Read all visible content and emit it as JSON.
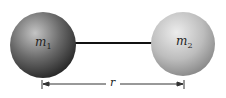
{
  "diagram": {
    "mass1": {
      "label": "m",
      "subscript": "1",
      "color_light": "#b8b8b8",
      "color_dark": "#3a3a3a"
    },
    "mass2": {
      "label": "m",
      "subscript": "2",
      "color_light": "#e6e6e6",
      "color_dark": "#9a9a9a"
    },
    "rod": {
      "color": "#111111"
    },
    "distance": {
      "label": "r"
    }
  }
}
